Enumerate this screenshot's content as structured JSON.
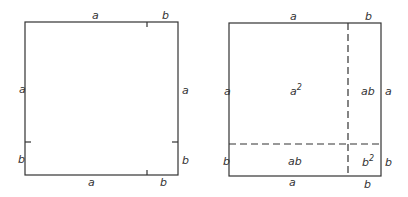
{
  "figure": {
    "left_square": {
      "top_labels": [
        "a",
        "b"
      ],
      "bottom_labels": [
        "a",
        "b"
      ],
      "left_labels": [
        "a",
        "b"
      ],
      "right_labels": [
        "a",
        "b"
      ]
    },
    "right_square": {
      "top_labels": [
        "a",
        "b"
      ],
      "bottom_labels": [
        "a",
        "b"
      ],
      "left_labels": [
        "a",
        "b"
      ],
      "right_labels": [
        "a",
        "b"
      ],
      "regions": {
        "big": "a",
        "big_exp": "2",
        "right_strip": "ab",
        "bottom_strip": "ab",
        "small": "b",
        "small_exp": "2"
      }
    }
  }
}
